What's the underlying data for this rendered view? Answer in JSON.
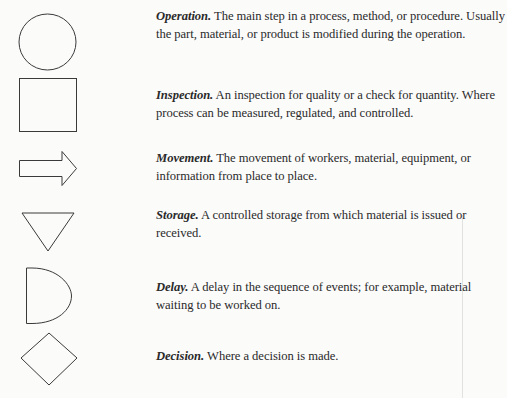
{
  "symbols": [
    {
      "shape": "circle-icon",
      "term": "Operation.",
      "text": " The main step in a process, method, or procedure. Usually the part, material, or product is modified during the operation."
    },
    {
      "shape": "square-icon",
      "term": "Inspection.",
      "text": " An inspection for quality or a check for quantity. Where process can be measured, regulated, and controlled."
    },
    {
      "shape": "arrow-right-icon",
      "term": "Movement.",
      "text": " The movement of workers, material, equipment, or information from place to place."
    },
    {
      "shape": "triangle-down-icon",
      "term": "Storage.",
      "text": " A controlled storage from which material is issued or received."
    },
    {
      "shape": "d-shape-icon",
      "term": "Delay.",
      "text": " A delay in the sequence of events; for example, material waiting to be worked on."
    },
    {
      "shape": "diamond-icon",
      "term": "Decision.",
      "text": " Where a decision is made."
    }
  ],
  "colors": {
    "stroke": "#3a3a3a",
    "text": "#2a2a2a",
    "background": "#fbfbfa"
  }
}
